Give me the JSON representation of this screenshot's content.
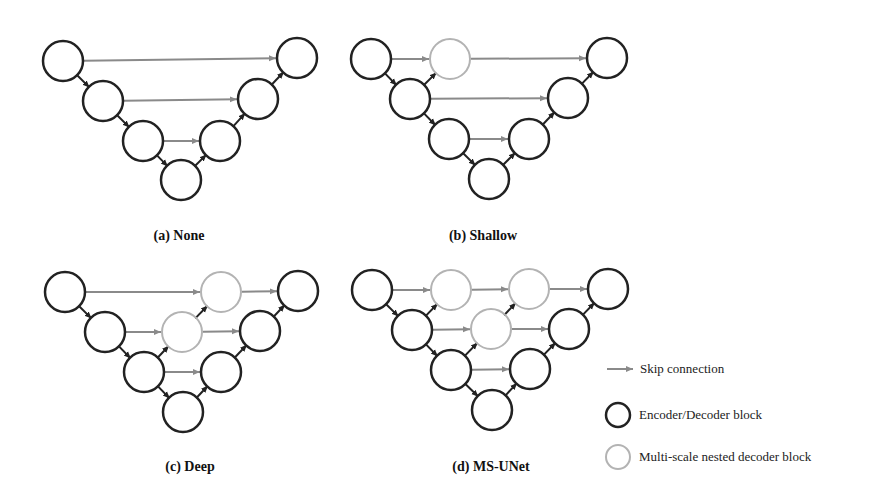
{
  "colors": {
    "block_stroke": "#222222",
    "nested_stroke": "#b3b3b3",
    "skip_arrow": "#8a8a8a",
    "path_arrow": "#222222"
  },
  "captions": {
    "a": "(a) None",
    "b": "(b) Shallow",
    "c": "(c) Deep",
    "d": "(d) MS-UNet"
  },
  "legend": {
    "skip": "Skip connection",
    "block": "Encoder/Decoder block",
    "nested": "Multi-scale nested decoder block"
  },
  "diagrams": [
    {
      "id": "a",
      "blocks": [
        [
          63,
          61
        ],
        [
          103,
          101
        ],
        [
          143,
          141
        ],
        [
          181,
          180
        ],
        [
          220,
          141
        ],
        [
          258,
          99
        ],
        [
          297,
          58
        ]
      ],
      "nested": [],
      "skips": [
        [
          [
            63,
            61
          ],
          [
            297,
            58
          ]
        ],
        [
          [
            103,
            101
          ],
          [
            258,
            99
          ]
        ],
        [
          [
            143,
            141
          ],
          [
            220,
            141
          ]
        ]
      ],
      "paths": [
        [
          [
            63,
            61
          ],
          [
            103,
            101
          ]
        ],
        [
          [
            103,
            101
          ],
          [
            143,
            141
          ]
        ],
        [
          [
            143,
            141
          ],
          [
            181,
            180
          ]
        ],
        [
          [
            181,
            180
          ],
          [
            220,
            141
          ]
        ],
        [
          [
            220,
            141
          ],
          [
            258,
            99
          ]
        ],
        [
          [
            258,
            99
          ],
          [
            297,
            58
          ]
        ]
      ]
    },
    {
      "id": "b",
      "blocks": [
        [
          371,
          59
        ],
        [
          410,
          99
        ],
        [
          449,
          139
        ],
        [
          489,
          179
        ],
        [
          529,
          139
        ],
        [
          568,
          98
        ],
        [
          607,
          58
        ]
      ],
      "nested": [
        [
          450,
          59
        ]
      ],
      "skips": [
        [
          [
            371,
            59
          ],
          [
            450,
            59
          ]
        ],
        [
          [
            450,
            59
          ],
          [
            607,
            58
          ]
        ],
        [
          [
            410,
            99
          ],
          [
            568,
            98
          ]
        ],
        [
          [
            449,
            139
          ],
          [
            529,
            139
          ]
        ]
      ],
      "paths": [
        [
          [
            371,
            59
          ],
          [
            410,
            99
          ]
        ],
        [
          [
            410,
            99
          ],
          [
            449,
            139
          ]
        ],
        [
          [
            449,
            139
          ],
          [
            489,
            179
          ]
        ],
        [
          [
            489,
            179
          ],
          [
            529,
            139
          ]
        ],
        [
          [
            529,
            139
          ],
          [
            568,
            98
          ]
        ],
        [
          [
            568,
            98
          ],
          [
            607,
            58
          ]
        ],
        [
          [
            410,
            99
          ],
          [
            450,
            59
          ]
        ]
      ]
    },
    {
      "id": "c",
      "blocks": [
        [
          65,
          292
        ],
        [
          105,
          332
        ],
        [
          144,
          372
        ],
        [
          183,
          412
        ],
        [
          221,
          372
        ],
        [
          260,
          331
        ],
        [
          298,
          291
        ]
      ],
      "nested": [
        [
          221,
          292
        ],
        [
          182,
          332
        ]
      ],
      "skips": [
        [
          [
            65,
            292
          ],
          [
            221,
            292
          ]
        ],
        [
          [
            221,
            292
          ],
          [
            298,
            291
          ]
        ],
        [
          [
            105,
            332
          ],
          [
            182,
            332
          ]
        ],
        [
          [
            182,
            332
          ],
          [
            260,
            331
          ]
        ],
        [
          [
            144,
            372
          ],
          [
            221,
            372
          ]
        ]
      ],
      "paths": [
        [
          [
            65,
            292
          ],
          [
            105,
            332
          ]
        ],
        [
          [
            105,
            332
          ],
          [
            144,
            372
          ]
        ],
        [
          [
            144,
            372
          ],
          [
            183,
            412
          ]
        ],
        [
          [
            183,
            412
          ],
          [
            221,
            372
          ]
        ],
        [
          [
            221,
            372
          ],
          [
            260,
            331
          ]
        ],
        [
          [
            260,
            331
          ],
          [
            298,
            291
          ]
        ],
        [
          [
            144,
            372
          ],
          [
            182,
            332
          ]
        ],
        [
          [
            182,
            332
          ],
          [
            221,
            292
          ]
        ]
      ]
    },
    {
      "id": "d",
      "blocks": [
        [
          372,
          290
        ],
        [
          412,
          330
        ],
        [
          451,
          370
        ],
        [
          492,
          410
        ],
        [
          530,
          369
        ],
        [
          569,
          329
        ],
        [
          608,
          289
        ]
      ],
      "nested": [
        [
          451,
          290
        ],
        [
          529,
          289
        ],
        [
          491,
          329
        ]
      ],
      "skips": [
        [
          [
            372,
            290
          ],
          [
            451,
            290
          ]
        ],
        [
          [
            451,
            290
          ],
          [
            529,
            289
          ]
        ],
        [
          [
            529,
            289
          ],
          [
            608,
            289
          ]
        ],
        [
          [
            412,
            330
          ],
          [
            491,
            329
          ]
        ],
        [
          [
            491,
            329
          ],
          [
            569,
            329
          ]
        ],
        [
          [
            451,
            370
          ],
          [
            530,
            369
          ]
        ]
      ],
      "paths": [
        [
          [
            372,
            290
          ],
          [
            412,
            330
          ]
        ],
        [
          [
            412,
            330
          ],
          [
            451,
            370
          ]
        ],
        [
          [
            451,
            370
          ],
          [
            492,
            410
          ]
        ],
        [
          [
            492,
            410
          ],
          [
            530,
            369
          ]
        ],
        [
          [
            530,
            369
          ],
          [
            569,
            329
          ]
        ],
        [
          [
            569,
            329
          ],
          [
            608,
            289
          ]
        ],
        [
          [
            412,
            330
          ],
          [
            451,
            290
          ]
        ],
        [
          [
            451,
            370
          ],
          [
            491,
            329
          ]
        ],
        [
          [
            491,
            329
          ],
          [
            529,
            289
          ]
        ]
      ]
    }
  ],
  "caption_positions": {
    "a": [
      179,
      236
    ],
    "b": [
      483,
      236
    ],
    "c": [
      190,
      467
    ],
    "d": [
      491,
      467
    ]
  }
}
